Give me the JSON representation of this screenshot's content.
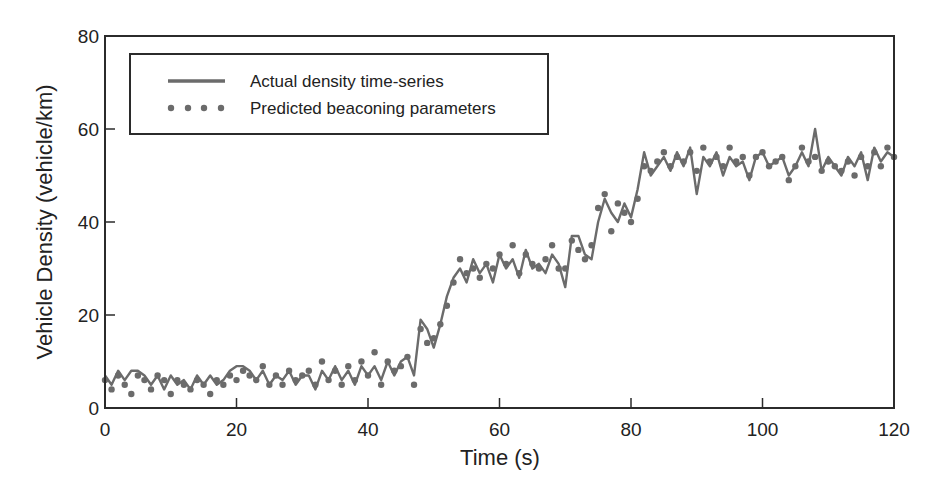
{
  "chart_data": {
    "type": "line",
    "title": "",
    "xlabel": "Time (s)",
    "ylabel": "Vehicle Density (vehicle/km)",
    "xlim": [
      0,
      120
    ],
    "ylim": [
      0,
      80
    ],
    "xticks": [
      0,
      20,
      40,
      60,
      80,
      100,
      120
    ],
    "yticks": [
      0,
      20,
      40,
      60,
      80
    ],
    "grid": false,
    "legend_position": "upper left",
    "series": [
      {
        "name": "Actual density time-series",
        "style": "line",
        "color": "#6b6b6b",
        "x": [
          0,
          1,
          2,
          3,
          4,
          5,
          6,
          7,
          8,
          9,
          10,
          11,
          12,
          13,
          14,
          15,
          16,
          17,
          18,
          19,
          20,
          21,
          22,
          23,
          24,
          25,
          26,
          27,
          28,
          29,
          30,
          31,
          32,
          33,
          34,
          35,
          36,
          37,
          38,
          39,
          40,
          41,
          42,
          43,
          44,
          45,
          46,
          47,
          48,
          49,
          50,
          51,
          52,
          53,
          54,
          55,
          56,
          57,
          58,
          59,
          60,
          61,
          62,
          63,
          64,
          65,
          66,
          67,
          68,
          69,
          70,
          71,
          72,
          73,
          74,
          75,
          76,
          77,
          78,
          79,
          80,
          81,
          82,
          83,
          84,
          85,
          86,
          87,
          88,
          89,
          90,
          91,
          92,
          93,
          94,
          95,
          96,
          97,
          98,
          99,
          100,
          101,
          102,
          103,
          104,
          105,
          106,
          107,
          108,
          109,
          110,
          111,
          112,
          113,
          114,
          115,
          116,
          117,
          118,
          119,
          120
        ],
        "values": [
          7,
          5,
          8,
          6,
          8,
          8,
          7,
          5,
          7,
          4,
          7,
          5,
          6,
          4,
          7,
          5,
          7,
          5,
          6,
          8,
          9,
          9,
          8,
          6,
          8,
          5,
          7,
          6,
          8,
          5,
          7,
          7,
          4,
          8,
          6,
          9,
          6,
          8,
          5,
          9,
          7,
          9,
          6,
          10,
          7,
          10,
          11,
          7,
          19,
          17,
          13,
          18,
          24,
          28,
          30,
          27,
          32,
          29,
          31,
          27,
          33,
          30,
          32,
          28,
          34,
          30,
          31,
          29,
          33,
          31,
          26,
          37,
          37,
          33,
          32,
          40,
          45,
          42,
          40,
          44,
          41,
          47,
          55,
          50,
          52,
          54,
          51,
          55,
          52,
          56,
          46,
          54,
          52,
          55,
          50,
          54,
          52,
          53,
          49,
          54,
          55,
          52,
          53,
          54,
          50,
          52,
          55,
          52,
          60,
          51,
          54,
          52,
          50,
          54,
          52,
          55,
          49,
          56,
          53,
          55,
          54
        ]
      },
      {
        "name": "Predicted beaconing parameters",
        "style": "dots",
        "color": "#6b6b6b",
        "x": [
          0,
          1,
          2,
          3,
          4,
          5,
          6,
          7,
          8,
          9,
          10,
          11,
          12,
          13,
          14,
          15,
          16,
          17,
          18,
          19,
          20,
          21,
          22,
          23,
          24,
          25,
          26,
          27,
          28,
          29,
          30,
          31,
          32,
          33,
          34,
          35,
          36,
          37,
          38,
          39,
          40,
          41,
          42,
          43,
          44,
          45,
          46,
          47,
          48,
          49,
          50,
          51,
          52,
          53,
          54,
          55,
          56,
          57,
          58,
          59,
          60,
          61,
          62,
          63,
          64,
          65,
          66,
          67,
          68,
          69,
          70,
          71,
          72,
          73,
          74,
          75,
          76,
          77,
          78,
          79,
          80,
          81,
          82,
          83,
          84,
          85,
          86,
          87,
          88,
          89,
          90,
          91,
          92,
          93,
          94,
          95,
          96,
          97,
          98,
          99,
          100,
          101,
          102,
          103,
          104,
          105,
          106,
          107,
          108,
          109,
          110,
          111,
          112,
          113,
          114,
          115,
          116,
          117,
          118,
          119,
          120
        ],
        "values": [
          6,
          4,
          7,
          5,
          3,
          7,
          6,
          4,
          7,
          6,
          3,
          6,
          5,
          4,
          6,
          5,
          3,
          6,
          5,
          7,
          6,
          8,
          7,
          6,
          9,
          5,
          7,
          5,
          8,
          6,
          7,
          8,
          5,
          10,
          6,
          8,
          5,
          9,
          6,
          10,
          7,
          12,
          5,
          10,
          8,
          9,
          11,
          5,
          17,
          14,
          15,
          18,
          22,
          27,
          32,
          29,
          30,
          28,
          31,
          30,
          33,
          31,
          35,
          29,
          33,
          31,
          30,
          32,
          35,
          30,
          30,
          36,
          34,
          32,
          35,
          43,
          46,
          38,
          44,
          42,
          40,
          45,
          52,
          51,
          53,
          55,
          52,
          54,
          53,
          55,
          51,
          56,
          53,
          54,
          52,
          56,
          53,
          54,
          50,
          54,
          55,
          52,
          53,
          54,
          49,
          52,
          56,
          53,
          54,
          51,
          53,
          52,
          51,
          53,
          50,
          54,
          52,
          55,
          52,
          56,
          54
        ]
      }
    ]
  },
  "legend": {
    "items": [
      {
        "label": "Actual density time-series"
      },
      {
        "label": "Predicted beaconing parameters"
      }
    ]
  }
}
